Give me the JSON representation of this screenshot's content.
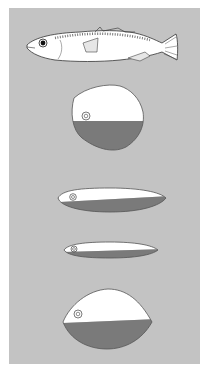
{
  "figure": {
    "panel_color": "#c3c3c3",
    "light_color": "#ffffff",
    "dark_color": "#7a7a7a",
    "items": [
      {
        "name": "fish-side-view"
      },
      {
        "name": "cross-section-deep-body"
      },
      {
        "name": "cross-section-elongate-1"
      },
      {
        "name": "cross-section-elongate-2"
      },
      {
        "name": "cross-section-oval"
      }
    ]
  }
}
